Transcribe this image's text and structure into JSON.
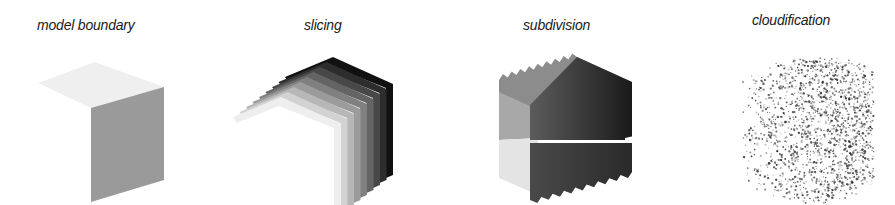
{
  "figure": {
    "panels": [
      {
        "id": "model-boundary",
        "label": "model boundary",
        "label_pos": {
          "x": 37,
          "y": 17
        }
      },
      {
        "id": "slicing",
        "label": "slicing",
        "label_pos": {
          "x": 304,
          "y": 17
        }
      },
      {
        "id": "subdivision",
        "label": "subdivision",
        "label_pos": {
          "x": 523,
          "y": 17
        }
      },
      {
        "id": "cloudification",
        "label": "cloudification",
        "label_pos": {
          "x": 752,
          "y": 12
        }
      }
    ],
    "colors": {
      "top_face": "#efefef",
      "front_face": "#999999",
      "slice_light": "#eeeeee",
      "slice_dark": "#111111",
      "sub_left_top": "#a5a5a5",
      "sub_left_bottom": "#e6e6e6",
      "sub_front_top": "#555555",
      "sub_front_bottom": "#3a3a3a",
      "cloud_dot": "#333333"
    },
    "slicing": {
      "slice_count": 9
    },
    "subdivision": {
      "tooth_count": 9
    }
  }
}
